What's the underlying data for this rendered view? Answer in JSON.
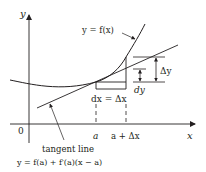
{
  "diagram": {
    "axes": {
      "x_label": "x",
      "y_label": "y",
      "origin_label": "0"
    },
    "curve_label": "y = f(x)",
    "tangent": {
      "label": "tangent line",
      "equation": "y = f(a) + f′(a)(x − a)"
    },
    "x_ticks": [
      {
        "label": "a"
      },
      {
        "label": "a + Δx"
      }
    ],
    "increment_labels": {
      "dx": "dx = Δx",
      "dy": "dy",
      "delta_y": "Δy"
    },
    "colors": {
      "ink": "#231f20",
      "background": "#ffffff"
    }
  }
}
